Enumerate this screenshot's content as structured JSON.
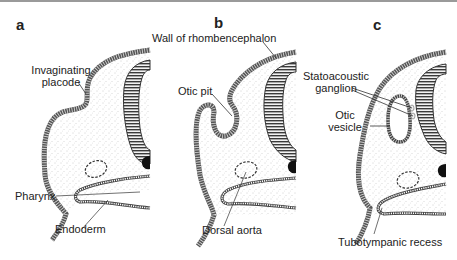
{
  "figure": {
    "panels": [
      {
        "letter": "a",
        "labels": {
          "placode": "Invaginating placode",
          "placode_line1": "Invaginating",
          "placode_line2": "placode",
          "pharynx": "Pharynx",
          "endoderm": "Endoderm"
        }
      },
      {
        "letter": "b",
        "labels": {
          "wall": "Wall of rhombencephalon",
          "otic_pit": "Otic pit",
          "dorsal_aorta": "Dorsal aorta"
        }
      },
      {
        "letter": "c",
        "labels": {
          "ganglion_line1": "Statoacoustic",
          "ganglion_line2": "ganglion",
          "vesicle_line1": "Otic",
          "vesicle_line2": "vesicle",
          "recess": "Tubotympanic recess"
        }
      }
    ],
    "colors": {
      "ectoderm": "#555555",
      "neural_tube": "#444444",
      "mesenchyme_dots": "#9a9a9a",
      "background": "#ffffff",
      "text": "#222222"
    }
  }
}
